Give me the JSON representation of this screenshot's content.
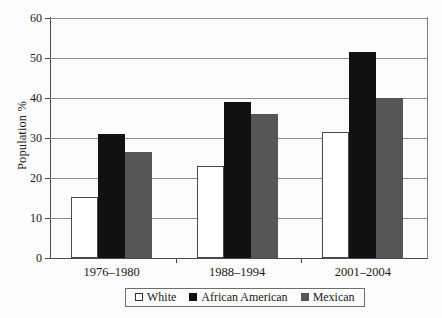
{
  "chart_data": {
    "type": "bar",
    "title": "",
    "subtitle": "",
    "xlabel": "",
    "ylabel": "Population %",
    "ylim": [
      0,
      60
    ],
    "ytick_labels": [
      "0",
      "10",
      "20",
      "30",
      "40",
      "50",
      "60"
    ],
    "ytick_values": [
      0,
      10,
      20,
      30,
      40,
      50,
      60
    ],
    "grid": true,
    "legend_position": "bottom-center",
    "categories": [
      "1976–1980",
      "1988–1994",
      "2001–2004"
    ],
    "series": [
      {
        "name": "White",
        "color": "#ffffff",
        "values": [
          15.3,
          23.0,
          31.4
        ]
      },
      {
        "name": "African American",
        "color": "#111111",
        "values": [
          31.0,
          39.0,
          51.4
        ]
      },
      {
        "name": "Mexican",
        "color": "#565656",
        "values": [
          26.4,
          36.1,
          40.0
        ]
      }
    ]
  },
  "axes": {
    "y_title": "Population %"
  },
  "legend": {
    "entries": [
      {
        "label": "White",
        "swatch": "legend-swatch-white"
      },
      {
        "label": "African American",
        "swatch": "legend-swatch-black"
      },
      {
        "label": "Mexican",
        "swatch": "legend-swatch-gray"
      }
    ]
  }
}
